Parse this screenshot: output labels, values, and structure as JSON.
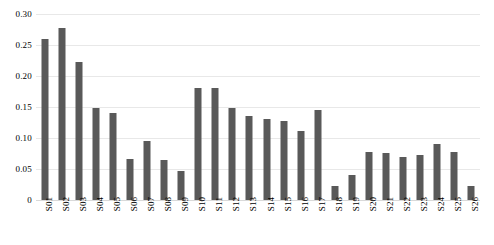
{
  "chart_data": {
    "type": "bar",
    "title": "",
    "subtitle": "",
    "xlabel": "",
    "ylabel": "",
    "ylim": [
      0,
      0.3
    ],
    "grid": true,
    "legend": "none",
    "bar_color": "#595959",
    "gridline_color": "#e8e8e8",
    "y_ticks": [
      "0",
      "0.05",
      "0.10",
      "0.15",
      "0.20",
      "0.25",
      "0.30"
    ],
    "y_tick_values": [
      0,
      0.05,
      0.1,
      0.15,
      0.2,
      0.25,
      0.3
    ],
    "categories": [
      "S01",
      "S02",
      "S03",
      "S04",
      "S05",
      "S06",
      "S07",
      "S08",
      "S09",
      "S10",
      "S11",
      "S12",
      "S13",
      "S14",
      "S15",
      "S16",
      "S17",
      "S18",
      "S19",
      "S20",
      "S21",
      "S22",
      "S23",
      "S24",
      "S25",
      "S26"
    ],
    "values": [
      0.259,
      0.277,
      0.222,
      0.148,
      0.14,
      0.066,
      0.095,
      0.064,
      0.047,
      0.18,
      0.18,
      0.148,
      0.136,
      0.13,
      0.127,
      0.111,
      0.145,
      0.022,
      0.04,
      0.078,
      0.076,
      0.07,
      0.072,
      0.09,
      0.078,
      0.022
    ]
  }
}
